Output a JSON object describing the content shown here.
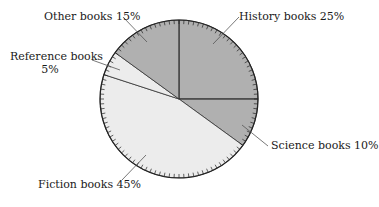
{
  "chart_data": {
    "type": "pie",
    "title": "",
    "start_angle_deg": 0,
    "direction": "clockwise",
    "slices": [
      {
        "label": "History books",
        "value": 25,
        "color": "#b0b0b0"
      },
      {
        "label": "Science books",
        "value": 10,
        "color": "#b0b0b0"
      },
      {
        "label": "Fiction books",
        "value": 45,
        "color": "#ececec"
      },
      {
        "label": "Reference books",
        "value": 5,
        "color": "#ececec"
      },
      {
        "label": "Other books",
        "value": 15,
        "color": "#b0b0b0"
      }
    ],
    "tick_marks": 100,
    "legend": "none",
    "annotations": [
      "History books 25%",
      "Science books 10%",
      "Fiction books 45%",
      "Reference books 5%",
      "Other books 15%"
    ]
  },
  "labels": {
    "history": "History books 25%",
    "science": "Science books 10%",
    "fiction": "Fiction books 45%",
    "reference_line1": "Reference books",
    "reference_line2": "5%",
    "other": "Other books 15%"
  }
}
